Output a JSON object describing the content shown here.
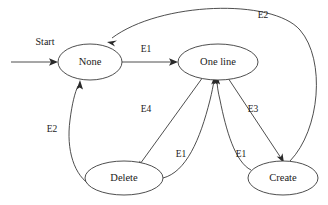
{
  "diagram": {
    "type": "state-transition-diagram",
    "background_color": "#ffffff",
    "stroke_color": "#3a3a3a",
    "text_color": "#1a1a1a",
    "start_label": "Start",
    "states": [
      {
        "id": "none",
        "label": "None",
        "cx": 90,
        "cy": 62,
        "rx": 32,
        "ry": 18
      },
      {
        "id": "one_line",
        "label": "One line",
        "cx": 218,
        "cy": 62,
        "rx": 40,
        "ry": 18
      },
      {
        "id": "delete",
        "label": "Delete",
        "cx": 124,
        "cy": 178,
        "rx": 39,
        "ry": 17
      },
      {
        "id": "create",
        "label": "Create",
        "cx": 283,
        "cy": 178,
        "rx": 35,
        "ry": 17
      }
    ],
    "transitions": [
      {
        "id": "none-to-one-line",
        "label": "E1",
        "from": "none",
        "to": "one_line",
        "label_x": 146,
        "label_y": 50
      },
      {
        "id": "create-to-none",
        "label": "E2",
        "from": "create",
        "to": "none",
        "label_x": 263,
        "label_y": 16
      },
      {
        "id": "delete-to-none",
        "label": "E2",
        "from": "delete",
        "to": "none",
        "label_x": 52,
        "label_y": 130
      },
      {
        "id": "one-line-to-delete",
        "label": "E4",
        "from": "one_line",
        "to": "delete",
        "label_x": 146,
        "label_y": 110
      },
      {
        "id": "delete-to-one-line",
        "label": "E1",
        "from": "delete",
        "to": "one_line",
        "label_x": 181,
        "label_y": 155
      },
      {
        "id": "one-line-to-create",
        "label": "E3",
        "from": "one_line",
        "to": "create",
        "label_x": 253,
        "label_y": 110
      },
      {
        "id": "create-to-one-line",
        "label": "E1",
        "from": "create",
        "to": "one_line",
        "label_x": 241,
        "label_y": 155
      }
    ]
  }
}
